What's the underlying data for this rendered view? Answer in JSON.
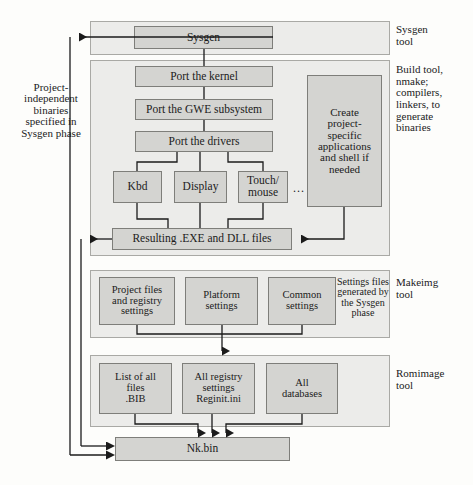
{
  "figure": {
    "kind": "flow-diagram"
  },
  "sections": {
    "sysgen": {
      "side_label": "Sysgen\ntool",
      "nodes": [
        {
          "label": "Sysgen"
        }
      ]
    },
    "build": {
      "side_label": "Build tool,\nnmake;\ncompilers,\nlinkers, to\ngenerate\nbinaries",
      "nodes": [
        {
          "label": "Port the kernel"
        },
        {
          "label": "Port the GWE subsystem"
        },
        {
          "label": "Port the drivers"
        },
        {
          "label": "Kbd"
        },
        {
          "label": "Display"
        },
        {
          "label": "Touch/\nmouse"
        },
        {
          "label": "Create\nproject-\nspecific\napplications\nand shell if\nneeded"
        },
        {
          "label": "Resulting .EXE and DLL files"
        }
      ],
      "ellipsis": "..."
    },
    "makeimg": {
      "side_label": "Makeimg\ntool",
      "caption": "Settings files\ngenerated by\nthe Sysgen\nphase",
      "nodes": [
        {
          "label": "Project files\nand registry\nsettings"
        },
        {
          "label": "Platform\nsettings"
        },
        {
          "label": "Common\nsettings"
        }
      ]
    },
    "romimage": {
      "side_label": "Romimage\ntool",
      "nodes": [
        {
          "label": "List of all\nfiles\n.BIB"
        },
        {
          "label": "All registry\nsettings\nReginit.ini"
        },
        {
          "label": "All\ndatabases"
        }
      ]
    },
    "output": {
      "nodes": [
        {
          "label": "Nk.bin"
        }
      ]
    }
  },
  "annotations": {
    "left_note": "Project-\nindependent\nbinaries\nspecified in\nSysgen phase"
  },
  "colors": {
    "page_background": "#fdfdfb",
    "panel_fill": "#ececea",
    "panel_stroke": "#a9a9a5",
    "node_fill": "#d4d4d1",
    "node_stroke": "#7e7e7a",
    "wire": "#1b1b1b",
    "text": "#1b1b1b"
  }
}
